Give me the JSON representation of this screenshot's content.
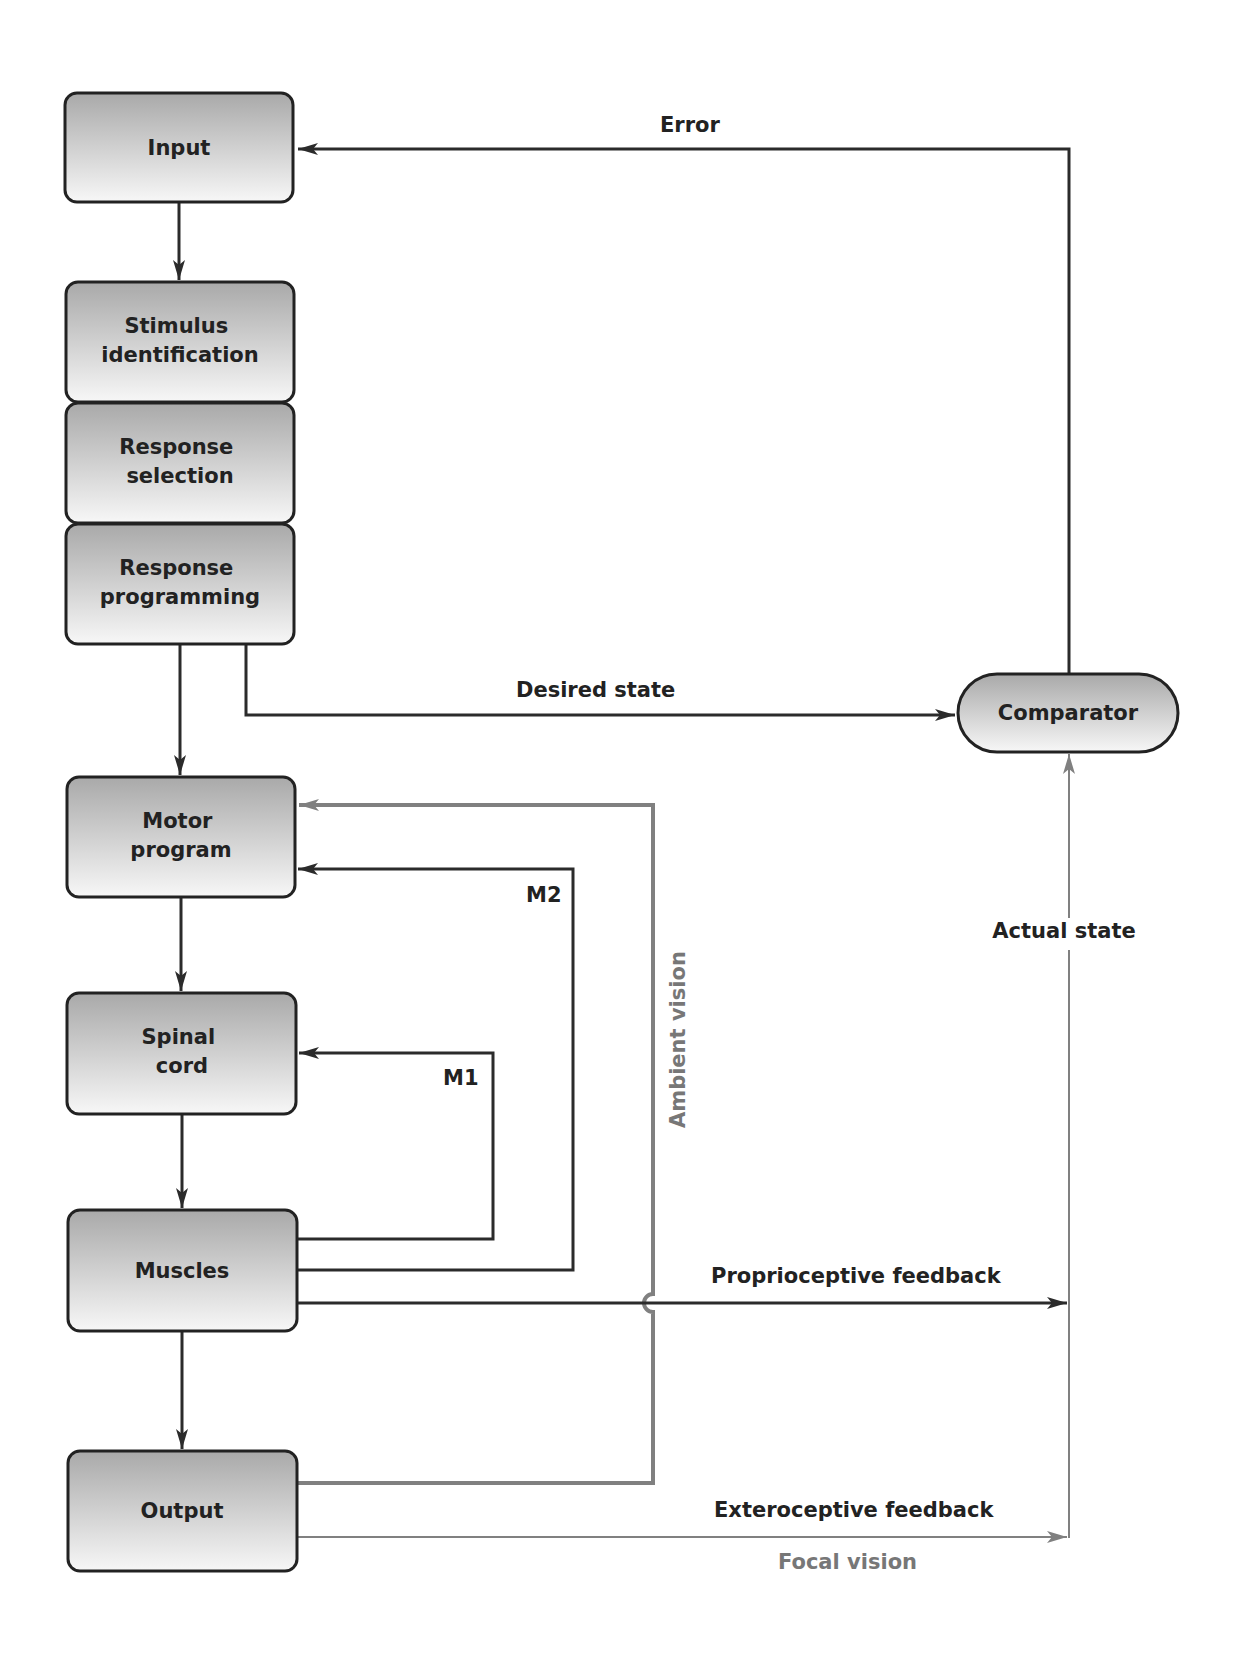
{
  "diagram": {
    "title": "",
    "boxes": {
      "input": {
        "lines": [
          "Input"
        ]
      },
      "stimulus_identification": {
        "lines": [
          "Stimulus",
          "identification"
        ]
      },
      "response_selection": {
        "lines": [
          "Response",
          "selection"
        ]
      },
      "response_programming": {
        "lines": [
          "Response",
          "programming"
        ]
      },
      "motor_program": {
        "lines": [
          "Motor",
          "program"
        ]
      },
      "spinal_cord": {
        "lines": [
          "Spinal",
          "cord"
        ]
      },
      "muscles": {
        "lines": [
          "Muscles"
        ]
      },
      "output": {
        "lines": [
          "Output"
        ]
      },
      "comparator": {
        "lines": [
          "Comparator"
        ]
      }
    },
    "labels": {
      "error": "Error",
      "desired_state": "Desired state",
      "actual_state": "Actual state",
      "m1": "M1",
      "m2": "M2",
      "ambient_vision": "Ambient vision",
      "proprioceptive_feedback": "Proprioceptive feedback",
      "exteroceptive_feedback": "Exteroceptive feedback",
      "focal_vision": "Focal vision"
    },
    "connections": [
      {
        "from": "Input",
        "to": "Stimulus identification",
        "style": "dark"
      },
      {
        "from": "Response programming",
        "to": "Motor program",
        "style": "dark"
      },
      {
        "from": "Response programming",
        "to": "Comparator",
        "label": "Desired state",
        "style": "dark"
      },
      {
        "from": "Comparator",
        "to": "Input",
        "label": "Error",
        "style": "dark"
      },
      {
        "from": "Motor program",
        "to": "Spinal cord",
        "style": "dark"
      },
      {
        "from": "Spinal cord",
        "to": "Muscles",
        "style": "dark"
      },
      {
        "from": "Muscles",
        "to": "Output",
        "style": "dark"
      },
      {
        "from": "Muscles",
        "to": "Spinal cord",
        "label": "M1",
        "style": "dark"
      },
      {
        "from": "Muscles",
        "to": "Motor program",
        "label": "M2",
        "style": "dark"
      },
      {
        "from": "Output",
        "to": "Motor program",
        "label": "Ambient vision",
        "style": "gray"
      },
      {
        "from": "Muscles",
        "to": "Comparator",
        "label": "Proprioceptive feedback",
        "style": "dark"
      },
      {
        "from": "Output",
        "to": "Comparator",
        "label": "Exteroceptive feedback / Focal vision",
        "style": "gray"
      },
      {
        "from": "feedback junction",
        "to": "Comparator",
        "label": "Actual state",
        "style": "gray"
      }
    ],
    "colors": {
      "dark_line": "#2b2b2b",
      "gray_line": "#808080",
      "box_gradient_top": "#a9a9a9",
      "box_gradient_bottom": "#f7f7f7",
      "gray_label": "#777777"
    }
  }
}
